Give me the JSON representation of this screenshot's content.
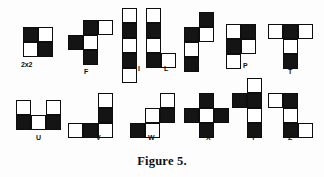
{
  "figure": {
    "caption": "Figure 5.",
    "cell_size": 15,
    "colors": {
      "black": "#141414",
      "white": "#ffffff",
      "stroke": "#0d0d0d",
      "background": "#ffffff"
    },
    "pieces": [
      {
        "id": "piece-2x2",
        "label": "2x2",
        "x": 23,
        "y": 27,
        "label_x": 21,
        "label_y": 61,
        "cells": [
          {
            "c": 0,
            "r": 0,
            "fill": "black"
          },
          {
            "c": 1,
            "r": 0,
            "fill": "white"
          },
          {
            "c": 0,
            "r": 1,
            "fill": "white"
          },
          {
            "c": 1,
            "r": 1,
            "fill": "black"
          }
        ]
      },
      {
        "id": "piece-f",
        "label": "F",
        "x": 68,
        "y": 20,
        "label_x": 84,
        "label_y": 68,
        "cells": [
          {
            "c": 1,
            "r": 0,
            "fill": "black"
          },
          {
            "c": 2,
            "r": 0,
            "fill": "white"
          },
          {
            "c": 0,
            "r": 1,
            "fill": "black"
          },
          {
            "c": 1,
            "r": 1,
            "fill": "white"
          },
          {
            "c": 1,
            "r": 2,
            "fill": "black"
          }
        ]
      },
      {
        "id": "piece-i",
        "label": "I",
        "x": 122,
        "y": 8,
        "label_x": 138,
        "label_y": 65,
        "cells": [
          {
            "c": 0,
            "r": 0,
            "fill": "white"
          },
          {
            "c": 0,
            "r": 1,
            "fill": "black"
          },
          {
            "c": 0,
            "r": 2,
            "fill": "white"
          },
          {
            "c": 0,
            "r": 3,
            "fill": "black"
          },
          {
            "c": 0,
            "r": 4,
            "fill": "white"
          }
        ]
      },
      {
        "id": "piece-l",
        "label": "L",
        "x": 146,
        "y": 8,
        "label_x": 164,
        "label_y": 65,
        "cells": [
          {
            "c": 0,
            "r": 0,
            "fill": "white"
          },
          {
            "c": 0,
            "r": 1,
            "fill": "black"
          },
          {
            "c": 0,
            "r": 2,
            "fill": "white"
          },
          {
            "c": 0,
            "r": 3,
            "fill": "black"
          },
          {
            "c": 1,
            "r": 3,
            "fill": "white"
          }
        ]
      },
      {
        "id": "piece-n",
        "label": "N",
        "x": 184,
        "y": 12,
        "label_x": 194,
        "label_y": 66,
        "cells": [
          {
            "c": 1,
            "r": 0,
            "fill": "black"
          },
          {
            "c": 0,
            "r": 1,
            "fill": "black"
          },
          {
            "c": 1,
            "r": 1,
            "fill": "white"
          },
          {
            "c": 0,
            "r": 2,
            "fill": "white"
          },
          {
            "c": 0,
            "r": 3,
            "fill": "black"
          }
        ]
      },
      {
        "id": "piece-p",
        "label": "P",
        "x": 226,
        "y": 24,
        "label_x": 243,
        "label_y": 62,
        "cells": [
          {
            "c": 0,
            "r": 0,
            "fill": "white"
          },
          {
            "c": 1,
            "r": 0,
            "fill": "black"
          },
          {
            "c": 0,
            "r": 1,
            "fill": "black"
          },
          {
            "c": 1,
            "r": 1,
            "fill": "white"
          },
          {
            "c": 0,
            "r": 2,
            "fill": "white"
          }
        ]
      },
      {
        "id": "piece-t",
        "label": "T",
        "x": 268,
        "y": 24,
        "label_x": 288,
        "label_y": 68,
        "cells": [
          {
            "c": 0,
            "r": 0,
            "fill": "white"
          },
          {
            "c": 1,
            "r": 0,
            "fill": "black"
          },
          {
            "c": 2,
            "r": 0,
            "fill": "white"
          },
          {
            "c": 1,
            "r": 1,
            "fill": "white"
          },
          {
            "c": 1,
            "r": 2,
            "fill": "black"
          }
        ]
      },
      {
        "id": "piece-u",
        "label": "U",
        "x": 16,
        "y": 100,
        "label_x": 36,
        "label_y": 134,
        "cells": [
          {
            "c": 0,
            "r": 0,
            "fill": "white"
          },
          {
            "c": 2,
            "r": 0,
            "fill": "white"
          },
          {
            "c": 0,
            "r": 1,
            "fill": "black"
          },
          {
            "c": 1,
            "r": 1,
            "fill": "white"
          },
          {
            "c": 2,
            "r": 1,
            "fill": "black"
          }
        ]
      },
      {
        "id": "piece-v",
        "label": "V",
        "x": 68,
        "y": 93,
        "label_x": 96,
        "label_y": 134,
        "cells": [
          {
            "c": 2,
            "r": 0,
            "fill": "white"
          },
          {
            "c": 2,
            "r": 1,
            "fill": "black"
          },
          {
            "c": 0,
            "r": 2,
            "fill": "white"
          },
          {
            "c": 1,
            "r": 2,
            "fill": "black"
          },
          {
            "c": 2,
            "r": 2,
            "fill": "white"
          }
        ]
      },
      {
        "id": "piece-w",
        "label": "W",
        "x": 130,
        "y": 93,
        "label_x": 148,
        "label_y": 134,
        "cells": [
          {
            "c": 2,
            "r": 0,
            "fill": "white"
          },
          {
            "c": 1,
            "r": 1,
            "fill": "white"
          },
          {
            "c": 2,
            "r": 1,
            "fill": "black"
          },
          {
            "c": 0,
            "r": 2,
            "fill": "black"
          },
          {
            "c": 1,
            "r": 2,
            "fill": "white"
          }
        ]
      },
      {
        "id": "piece-x",
        "label": "X",
        "x": 184,
        "y": 93,
        "label_x": 206,
        "label_y": 134,
        "cells": [
          {
            "c": 1,
            "r": 0,
            "fill": "black"
          },
          {
            "c": 0,
            "r": 1,
            "fill": "black"
          },
          {
            "c": 1,
            "r": 1,
            "fill": "white"
          },
          {
            "c": 2,
            "r": 1,
            "fill": "black"
          },
          {
            "c": 1,
            "r": 2,
            "fill": "black"
          }
        ]
      },
      {
        "id": "piece-y",
        "label": "Y",
        "x": 232,
        "y": 78,
        "label_x": 251,
        "label_y": 134,
        "cells": [
          {
            "c": 1,
            "r": 0,
            "fill": "white"
          },
          {
            "c": 0,
            "r": 1,
            "fill": "black"
          },
          {
            "c": 1,
            "r": 1,
            "fill": "black"
          },
          {
            "c": 1,
            "r": 2,
            "fill": "white"
          },
          {
            "c": 1,
            "r": 3,
            "fill": "black"
          }
        ]
      },
      {
        "id": "piece-z",
        "label": "Z",
        "x": 268,
        "y": 93,
        "label_x": 288,
        "label_y": 134,
        "cells": [
          {
            "c": 0,
            "r": 0,
            "fill": "white"
          },
          {
            "c": 1,
            "r": 0,
            "fill": "black"
          },
          {
            "c": 1,
            "r": 1,
            "fill": "white"
          },
          {
            "c": 1,
            "r": 2,
            "fill": "black"
          },
          {
            "c": 2,
            "r": 2,
            "fill": "white"
          }
        ]
      }
    ]
  }
}
